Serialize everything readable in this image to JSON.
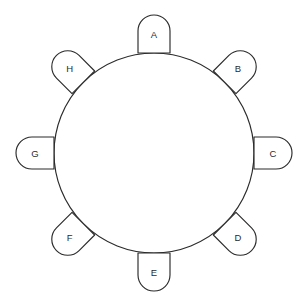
{
  "diagram": {
    "type": "circle-with-labeled-arch-markers",
    "canvas": {
      "width": 307,
      "height": 306,
      "background": "#ffffff"
    },
    "stroke_color": "#2b2b2b",
    "stroke_width": 1.15,
    "label_color": "#2b2b2b",
    "circle": {
      "center_x": 154,
      "center_y": 153,
      "radius": 100
    },
    "marker_shape": {
      "name": "arch",
      "description": "flat base with semicircular top",
      "width": 32,
      "height": 38,
      "base_offset_from_circle": 0
    },
    "markers": [
      {
        "label": "A",
        "angle_deg": 0,
        "cx": 154.0,
        "cy": 34.0,
        "rotation_deg": 0
      },
      {
        "label": "B",
        "angle_deg": 45,
        "cx": 238.1,
        "cy": 68.9,
        "rotation_deg": 45
      },
      {
        "label": "C",
        "angle_deg": 90,
        "cx": 273.0,
        "cy": 153.0,
        "rotation_deg": 90
      },
      {
        "label": "D",
        "angle_deg": 135,
        "cx": 238.1,
        "cy": 237.1,
        "rotation_deg": 135
      },
      {
        "label": "E",
        "angle_deg": 180,
        "cx": 154.0,
        "cy": 272.0,
        "rotation_deg": 180
      },
      {
        "label": "F",
        "angle_deg": 225,
        "cx": 69.9,
        "cy": 237.1,
        "rotation_deg": 225
      },
      {
        "label": "G",
        "angle_deg": 270,
        "cx": 35.0,
        "cy": 153.0,
        "rotation_deg": 270
      },
      {
        "label": "H",
        "angle_deg": 315,
        "cx": 69.9,
        "cy": 68.9,
        "rotation_deg": 315
      }
    ]
  },
  "chart_data": {
    "type": "diagram",
    "title": "",
    "categories": [
      "A",
      "B",
      "C",
      "D",
      "E",
      "F",
      "G",
      "H"
    ],
    "values": [
      0,
      45,
      90,
      135,
      180,
      225,
      270,
      315
    ],
    "xlabel": "",
    "ylabel": "",
    "annotations": [
      "A",
      "B",
      "C",
      "D",
      "E",
      "F",
      "G",
      "H"
    ],
    "legend": []
  }
}
